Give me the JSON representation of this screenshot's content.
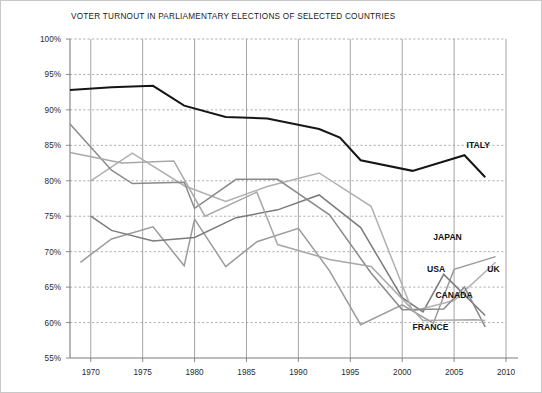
{
  "chart_data": {
    "type": "line",
    "title": "VOTER TURNOUT IN PARLIAMENTARY ELECTIONS OF SELECTED COUNTRIES",
    "xlabel": "",
    "ylabel": "",
    "xlim": [
      1968,
      2010
    ],
    "ylim": [
      55,
      100
    ],
    "grid": "horizontal-dashed-and-vertical-solid",
    "legend_position": "inline-right-end-labels",
    "y_ticks": [
      55,
      60,
      65,
      70,
      75,
      80,
      85,
      90,
      95,
      100
    ],
    "y_tick_labels": [
      "55%",
      "60%",
      "65%",
      "70%",
      "75%",
      "80%",
      "85%",
      "90%",
      "95%",
      "100%"
    ],
    "x_ticks": [
      1970,
      1975,
      1980,
      1985,
      1990,
      1995,
      2000,
      2005,
      2010
    ],
    "x_tick_labels": [
      "1970",
      "1975",
      "1980",
      "1985",
      "1990",
      "1995",
      "2000",
      "2005",
      "2010"
    ],
    "series": [
      {
        "name": "ITALY",
        "color": "#161616",
        "width": 2.0,
        "label_x": 2006.2,
        "label_y": 84.6,
        "points": [
          [
            1968,
            92.8
          ],
          [
            1972,
            93.2
          ],
          [
            1976,
            93.4
          ],
          [
            1979,
            90.6
          ],
          [
            1983,
            89.0
          ],
          [
            1987,
            88.8
          ],
          [
            1992,
            87.3
          ],
          [
            1994,
            86.1
          ],
          [
            1996,
            82.9
          ],
          [
            2001,
            81.4
          ],
          [
            2006,
            83.6
          ],
          [
            2008,
            80.5
          ]
        ]
      },
      {
        "name": "JAPAN",
        "color": "#9b9b9b",
        "width": 1.5,
        "label_x": 2003.0,
        "label_y": 71.6,
        "points": [
          [
            1969,
            68.5
          ],
          [
            1972,
            71.8
          ],
          [
            1976,
            73.5
          ],
          [
            1979,
            68.0
          ],
          [
            1980,
            74.6
          ],
          [
            1983,
            67.9
          ],
          [
            1986,
            71.4
          ],
          [
            1990,
            73.3
          ],
          [
            1993,
            67.3
          ],
          [
            1996,
            59.7
          ],
          [
            2000,
            62.5
          ],
          [
            2003,
            59.9
          ],
          [
            2005,
            67.5
          ],
          [
            2009,
            69.3
          ]
        ]
      },
      {
        "name": "USA",
        "color": "#7b7b7b",
        "width": 1.5,
        "label_x": 2002.4,
        "label_y": 67.2,
        "points": [
          [
            1970,
            75.0
          ],
          [
            1972,
            73.0
          ],
          [
            1976,
            71.5
          ],
          [
            1980,
            72.0
          ],
          [
            1984,
            74.8
          ],
          [
            1988,
            75.9
          ],
          [
            1992,
            78.0
          ],
          [
            1996,
            73.4
          ],
          [
            2000,
            63.5
          ],
          [
            2002,
            61.5
          ],
          [
            2004,
            66.8
          ],
          [
            2008,
            61.0
          ]
        ]
      },
      {
        "name": "UK",
        "color": "#b0b0b0",
        "width": 1.5,
        "label_x": 2008.2,
        "label_y": 67.2,
        "points": [
          [
            1970,
            80.0
          ],
          [
            1974,
            83.9
          ],
          [
            1979,
            79.3
          ],
          [
            1983,
            77.1
          ],
          [
            1987,
            79.2
          ],
          [
            1992,
            81.1
          ],
          [
            1997,
            76.4
          ],
          [
            2001,
            61.6
          ],
          [
            2005,
            63.1
          ],
          [
            2009,
            68.5
          ]
        ]
      },
      {
        "name": "CANADA",
        "color": "#8a8a8a",
        "width": 1.5,
        "label_x": 2003.2,
        "label_y": 63.4,
        "points": [
          [
            1968,
            88.0
          ],
          [
            1972,
            81.5
          ],
          [
            1974,
            79.6
          ],
          [
            1979,
            79.8
          ],
          [
            1980,
            76.1
          ],
          [
            1984,
            80.2
          ],
          [
            1988,
            80.2
          ],
          [
            1993,
            75.2
          ],
          [
            1997,
            67.0
          ],
          [
            2000,
            61.8
          ],
          [
            2004,
            61.9
          ],
          [
            2006,
            65.0
          ],
          [
            2008,
            59.4
          ]
        ]
      },
      {
        "name": "FRANCE",
        "color": "#a8a8a8",
        "width": 1.5,
        "label_x": 2001.0,
        "label_y": 58.9,
        "points": [
          [
            1968,
            84.0
          ],
          [
            1973,
            82.5
          ],
          [
            1978,
            82.8
          ],
          [
            1981,
            75.0
          ],
          [
            1986,
            78.4
          ],
          [
            1988,
            71.0
          ],
          [
            1993,
            68.9
          ],
          [
            1997,
            67.9
          ],
          [
            2002,
            60.3
          ],
          [
            2007,
            60.4
          ],
          [
            2008,
            60.3
          ]
        ]
      }
    ]
  }
}
